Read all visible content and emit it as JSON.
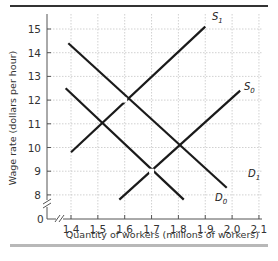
{
  "chart_data": {
    "type": "line",
    "title": "",
    "xlabel": "Quantity of workers (millions of workers)",
    "ylabel": "Wage rate (dollars per hour)",
    "x_ticks": [
      "1.4",
      "1.5",
      "1.6",
      "1.7",
      "1.8",
      "1.9",
      "2.0",
      "2.1"
    ],
    "y_ticks": [
      "8",
      "9",
      "10",
      "11",
      "12",
      "13",
      "14",
      "15"
    ],
    "origin_label": "0",
    "xlim": [
      1.3,
      2.1
    ],
    "ylim": [
      7,
      15.5
    ],
    "axis_breaks": {
      "x": true,
      "y": true
    },
    "grid": true,
    "series": [
      {
        "name": "S1",
        "label_main": "S",
        "label_sub": "1",
        "kind": "supply",
        "points": [
          [
            1.4,
            9.8
          ],
          [
            1.9,
            15.1
          ]
        ]
      },
      {
        "name": "S0",
        "label_main": "S",
        "label_sub": "0",
        "kind": "supply",
        "points": [
          [
            1.58,
            7.8
          ],
          [
            2.03,
            12.4
          ]
        ]
      },
      {
        "name": "D1",
        "label_main": "D",
        "label_sub": "1",
        "kind": "demand",
        "points": [
          [
            1.39,
            14.4
          ],
          [
            1.98,
            8.3
          ]
        ]
      },
      {
        "name": "D0",
        "label_main": "D",
        "label_sub": "0",
        "kind": "demand",
        "points": [
          [
            1.38,
            12.5
          ],
          [
            1.82,
            7.8
          ]
        ]
      }
    ],
    "equilibrium_points": [
      {
        "label": "S1-D1",
        "x": 1.6,
        "y": 12
      },
      {
        "label": "S0-D0",
        "x": 1.7,
        "y": 9
      }
    ],
    "colors": {
      "line": "#1a1a1a",
      "grid": "#bdbdbd",
      "rule_top": "#333333",
      "rule_bottom": "#b8b8b8"
    }
  }
}
